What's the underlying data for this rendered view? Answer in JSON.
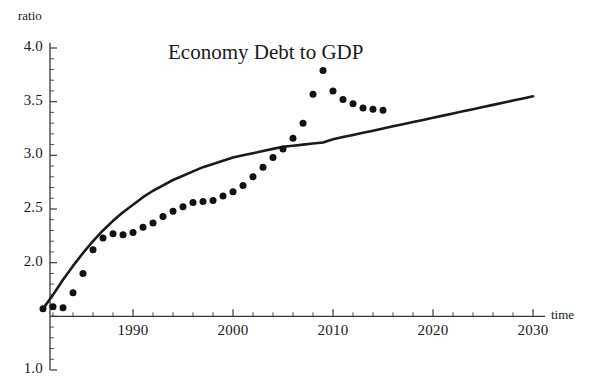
{
  "chart_data": {
    "type": "line",
    "title": "Economy  Debt  to  GDP",
    "xlabel": "time",
    "ylabel": "ratio",
    "xlim": [
      1981,
      2031
    ],
    "ylim": [
      1.0,
      4.05
    ],
    "grid": false,
    "legend": null,
    "xticks": [
      1990,
      2000,
      2010,
      2020,
      2030
    ],
    "xtick_labels": [
      "1990",
      "2000",
      "2010",
      "2020",
      "2030"
    ],
    "xminor_step": 2,
    "yticks": [
      1.0,
      2.0,
      2.5,
      3.0,
      3.5,
      4.0
    ],
    "ytick_labels": [
      "1.0",
      "2.0",
      "2.5",
      "3.0",
      "3.5",
      "4.0"
    ],
    "yminor_step": 0.1,
    "x_axis_crossing_y": 1.5,
    "series": [
      {
        "name": "model curve",
        "style": "solid-line",
        "color": "#1a1a1a",
        "x": [
          1981,
          1982,
          1983,
          1984,
          1985,
          1986,
          1987,
          1988,
          1989,
          1990,
          1991,
          1992,
          1993,
          1994,
          1995,
          1996,
          1997,
          1998,
          1999,
          2000,
          2001,
          2002,
          2003,
          2004,
          2005,
          2006,
          2007,
          2008,
          2009,
          2010,
          2011,
          2012,
          2013,
          2014,
          2015,
          2016,
          2017,
          2018,
          2019,
          2020,
          2021,
          2022,
          2023,
          2024,
          2025,
          2026,
          2027,
          2028,
          2029,
          2030
        ],
        "y": [
          1.57,
          1.7,
          1.84,
          1.97,
          2.09,
          2.2,
          2.3,
          2.39,
          2.47,
          2.54,
          2.61,
          2.67,
          2.72,
          2.77,
          2.81,
          2.85,
          2.89,
          2.92,
          2.95,
          2.98,
          3.0,
          3.02,
          3.04,
          3.06,
          3.08,
          3.09,
          3.1,
          3.11,
          3.12,
          3.15,
          3.17,
          3.19,
          3.21,
          3.23,
          3.25,
          3.27,
          3.29,
          3.31,
          3.33,
          3.35,
          3.37,
          3.39,
          3.41,
          3.43,
          3.45,
          3.47,
          3.49,
          3.51,
          3.53,
          3.55
        ]
      },
      {
        "name": "historical data",
        "style": "points",
        "color": "#111111",
        "x": [
          1981,
          1982,
          1983,
          1984,
          1985,
          1986,
          1987,
          1988,
          1989,
          1990,
          1991,
          1992,
          1993,
          1994,
          1995,
          1996,
          1997,
          1998,
          1999,
          2000,
          2001,
          2002,
          2003,
          2004,
          2005,
          2006,
          2007,
          2008,
          2009,
          2010,
          2011,
          2012,
          2013,
          2014,
          2015
        ],
        "y": [
          1.57,
          1.59,
          1.58,
          1.72,
          1.9,
          2.12,
          2.23,
          2.27,
          2.26,
          2.28,
          2.33,
          2.37,
          2.43,
          2.48,
          2.52,
          2.56,
          2.57,
          2.58,
          2.62,
          2.66,
          2.72,
          2.8,
          2.89,
          2.98,
          3.06,
          3.16,
          3.3,
          3.57,
          3.79,
          3.6,
          3.52,
          3.48,
          3.44,
          3.43,
          3.42
        ]
      }
    ]
  }
}
